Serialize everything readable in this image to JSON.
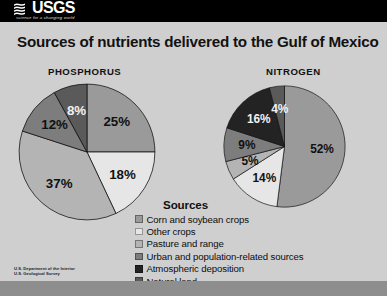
{
  "slide": {
    "background_color": "#cfcfcf",
    "header_background": "#000000"
  },
  "logo": {
    "wordmark": "USGS",
    "tagline": "science for a changing world",
    "mark_icon": "usgs-wave-icon"
  },
  "title": "Sources of nutrients delivered to the Gulf of Mexico",
  "panels": [
    {
      "heading": "PHOSPHORUS"
    },
    {
      "heading": "NITROGEN"
    }
  ],
  "legend": {
    "title": "Sources",
    "items": [
      {
        "label": "Corn and soybean crops",
        "color": "#9a9a9a"
      },
      {
        "label": "Other crops",
        "color": "#e6e6e6"
      },
      {
        "label": "Pasture and range",
        "color": "#b4b4b4"
      },
      {
        "label": "Urban and population-related sources",
        "color": "#7d7d7d"
      },
      {
        "label": "Atmospheric deposition",
        "color": "#232323"
      },
      {
        "label": "Natural land",
        "color": "#5a5a5a"
      }
    ]
  },
  "footer": {
    "lines": [
      "U.S. Department of the Interior",
      "U.S. Geological Survey"
    ]
  },
  "caption_sliver": "",
  "chart_data": [
    {
      "type": "pie",
      "title": "PHOSPHORUS",
      "categories": [
        "Corn and soybean crops",
        "Other crops",
        "Pasture and range",
        "Urban and population-related sources",
        "Natural land"
      ],
      "values": [
        25,
        18,
        37,
        12,
        8
      ],
      "labels": [
        "25%",
        "18%",
        "37%",
        "12%",
        "8%"
      ],
      "colors": [
        "#9a9a9a",
        "#e6e6e6",
        "#b4b4b4",
        "#7d7d7d",
        "#5a5a5a"
      ],
      "units": "percent",
      "start_angle_deg": 0,
      "direction": "clockwise",
      "legend_position": "bottom-center",
      "grid": false
    },
    {
      "type": "pie",
      "title": "NITROGEN",
      "categories": [
        "Corn and soybean crops",
        "Other crops",
        "Pasture and range",
        "Urban and population-related sources",
        "Atmospheric deposition",
        "Natural land"
      ],
      "values": [
        52,
        14,
        5,
        9,
        16,
        4
      ],
      "labels": [
        "52%",
        "14%",
        "5%",
        "9%",
        "16%",
        "4%"
      ],
      "colors": [
        "#9a9a9a",
        "#e6e6e6",
        "#b4b4b4",
        "#7d7d7d",
        "#232323",
        "#5a5a5a"
      ],
      "units": "percent",
      "start_angle_deg": 0,
      "direction": "clockwise",
      "legend_position": "bottom-center",
      "grid": false
    }
  ]
}
